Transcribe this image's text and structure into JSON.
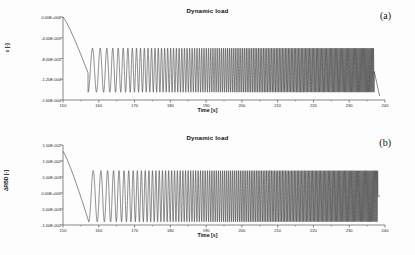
{
  "figure": {
    "background": "#fdfdfd",
    "line_color": "#2b2b2b",
    "axis_color": "#555555"
  },
  "panels": [
    {
      "id": "a",
      "panel_label": "(a)",
      "title": "Dynamic load",
      "xlabel": "Time [s]",
      "ylabel": "ε [-]",
      "xticks": [
        "150",
        "160",
        "170",
        "180",
        "190",
        "200",
        "210",
        "220",
        "230",
        "240"
      ],
      "yticks": [
        "0.00E+000",
        "-4.00E-005",
        "-8.00E-005",
        "-1.20E-004",
        "-1.60E-004"
      ]
    },
    {
      "id": "b",
      "panel_label": "(b)",
      "title": "Dynamic load",
      "xlabel": "Time [s]",
      "ylabel": "ΔRBD [-]",
      "xticks": [
        "150",
        "160",
        "170",
        "180",
        "190",
        "200",
        "210",
        "220",
        "230",
        "240"
      ],
      "yticks": [
        "1.50E-002",
        "1.00E-002",
        "5.00E-003",
        "0.00E+000",
        "-5.00E-003",
        "-1.00E-002"
      ]
    }
  ],
  "chart_data": [
    {
      "type": "line",
      "id": "a",
      "title": "Dynamic load",
      "panel_label": "(a)",
      "xlabel": "Time [s]",
      "ylabel": "ε [-]",
      "xlim": [
        150,
        240
      ],
      "ylim": [
        -0.00016,
        0.0
      ],
      "xticks": [
        150,
        160,
        170,
        180,
        190,
        200,
        210,
        220,
        230,
        240
      ],
      "yticks": [
        0.0,
        -4e-05,
        -8e-05,
        -0.00012,
        -0.00016
      ],
      "grid": false,
      "legend": "none",
      "description": "Monotonic ramp from 0 at t=150 down to the mean level near -1.05E-004 at t=157, followed by a sinusoidal chirp whose frequency increases continuously with time; envelope peaks near -6.0E-005 and troughs near -1.45E-004. Oscillations become visually unresolved (solid band) after t=232, ending with a final drop at t=237.",
      "series": [
        {
          "name": "strain",
          "ramp": {
            "x_start": 150,
            "y_start": 0.0,
            "x_end": 157.0,
            "y_end": -0.000108
          },
          "chirp": {
            "x_start": 157.0,
            "x_end": 237.0,
            "mean": -0.0001025,
            "amplitude_start": 4.25e-05,
            "amplitude_end": 4.25e-05,
            "freq_start_hz": 0.38,
            "freq_end_hz": 3.3,
            "envelope_top_start": -6e-05,
            "envelope_top_end": -6e-05,
            "envelope_bottom_start": -0.000145,
            "envelope_bottom_end": -0.000145
          },
          "tail": {
            "x_start": 237.0,
            "y_start": -0.000105,
            "x_end": 238.5,
            "y_end": -0.0001525
          }
        }
      ]
    },
    {
      "type": "line",
      "id": "b",
      "title": "Dynamic load",
      "panel_label": "(b)",
      "xlabel": "Time [s]",
      "ylabel": "ΔRBD [-]",
      "xlim": [
        150,
        240
      ],
      "ylim": [
        -0.01,
        0.015
      ],
      "xticks": [
        150,
        160,
        170,
        180,
        190,
        200,
        210,
        220,
        230,
        240
      ],
      "yticks": [
        0.015,
        0.01,
        0.005,
        0.0,
        -0.005,
        -0.01
      ],
      "grid": false,
      "legend": "none",
      "description": "Starts near 1.30E-002 at t=150, decays steeply to about -9.0E-003 by t=157, then follows a sinusoidal chirp of increasing frequency oscillating between roughly +7.0E-003 and -9.0E-003; the band becomes solid black after t=231 and the trace ends at t=238.",
      "series": [
        {
          "name": "delta-rbd",
          "ramp": {
            "x_start": 150,
            "y_start": 0.013,
            "x_end": 157.2,
            "y_end": -0.009
          },
          "chirp": {
            "x_start": 157.2,
            "x_end": 238.0,
            "mean": -0.001,
            "amplitude_start": 0.008,
            "amplitude_end": 0.008,
            "freq_start_hz": 0.38,
            "freq_end_hz": 3.3,
            "envelope_top_start": 0.007,
            "envelope_top_end": 0.007,
            "envelope_bottom_start": -0.009,
            "envelope_bottom_end": -0.009
          },
          "tail": {
            "x_start": 238.0,
            "y_start": -0.001,
            "x_end": 238.6,
            "y_end": -0.001
          }
        }
      ]
    }
  ]
}
